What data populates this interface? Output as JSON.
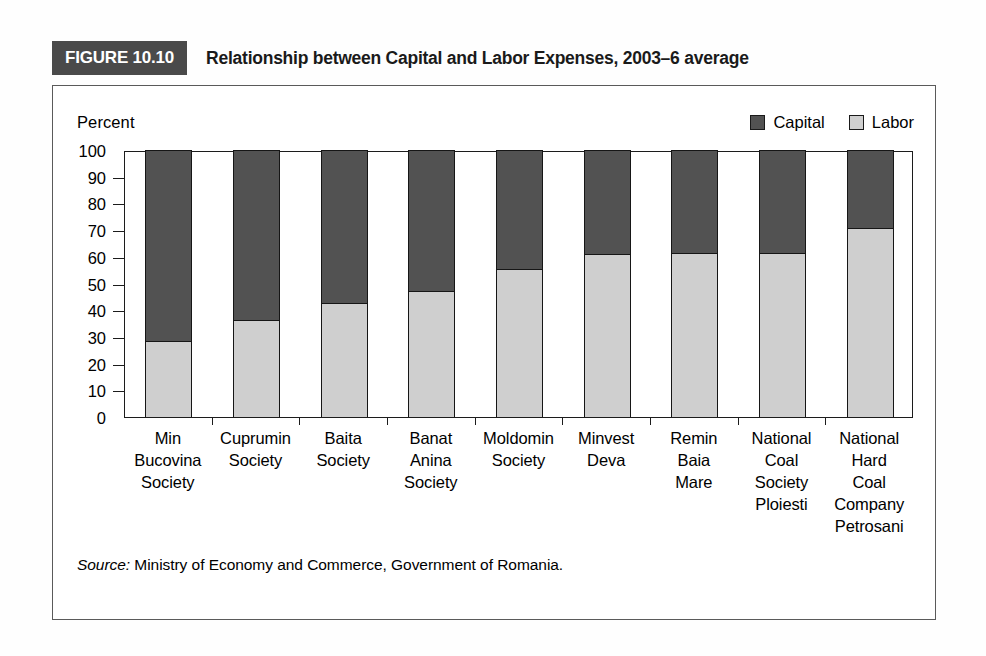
{
  "figure": {
    "tag": "FIGURE 10.10",
    "title": "Relationship between Capital and Labor Expenses, 2003–6 average",
    "source_prefix": "Source:",
    "source_text": " Ministry of Economy and Commerce, Government of Romania."
  },
  "legend": {
    "items": [
      {
        "label": "Capital",
        "color": "#525252"
      },
      {
        "label": "Labor",
        "color": "#cfcfcf"
      }
    ]
  },
  "chart_data": {
    "type": "bar",
    "subtype": "stacked-100-percent",
    "title": "Relationship between Capital and Labor Expenses, 2003–6 average",
    "xlabel": "",
    "ylabel": "Percent",
    "ylim": [
      0,
      100
    ],
    "yticks": [
      0,
      10,
      20,
      30,
      40,
      50,
      60,
      70,
      80,
      90,
      100
    ],
    "ytick_labels": [
      "0",
      "10",
      "20",
      "30",
      "40",
      "50",
      "60",
      "70",
      "80",
      "90",
      "100"
    ],
    "grid": false,
    "legend_position": "top-right",
    "categories": [
      "Min Bucovina Society",
      "Cuprumin Society",
      "Baita Society",
      "Banat Anina Society",
      "Moldomin Society",
      "Minvest Deva",
      "Remin Baia Mare",
      "National Coal Society Ploiesti",
      "National Hard Coal Company Petrosani"
    ],
    "category_lines": [
      [
        "Min",
        "Bucovina",
        "Society"
      ],
      [
        "Cuprumin",
        "Society"
      ],
      [
        "Baita",
        "Society"
      ],
      [
        "Banat",
        "Anina",
        "Society"
      ],
      [
        "Moldomin",
        "Society"
      ],
      [
        "Minvest",
        "Deva"
      ],
      [
        "Remin",
        "Baia",
        "Mare"
      ],
      [
        "National",
        "Coal",
        "Society",
        "Ploiesti"
      ],
      [
        "National",
        "Hard",
        "Coal",
        "Company",
        "Petrosani"
      ]
    ],
    "series": [
      {
        "name": "Labor",
        "color": "#cfcfcf",
        "values": [
          28,
          36,
          42.5,
          47,
          55,
          60.5,
          61,
          61,
          70.5
        ]
      },
      {
        "name": "Capital",
        "color": "#525252",
        "values": [
          72,
          64,
          57.5,
          53,
          45,
          39.5,
          39,
          39,
          29.5
        ]
      }
    ]
  }
}
